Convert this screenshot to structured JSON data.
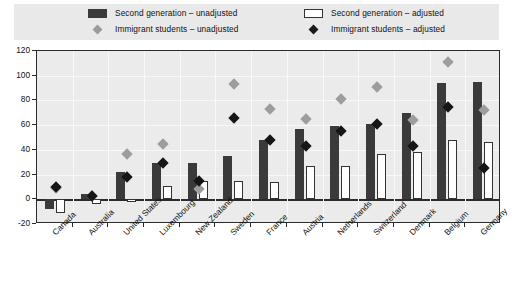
{
  "legend": {
    "items": [
      {
        "label": "Second generation – unadjusted",
        "marker": "dark-square",
        "color": "#3a3a3a"
      },
      {
        "label": "Immigrant students – unadjusted",
        "marker": "grey-diamond",
        "color": "#9d9d9d"
      },
      {
        "label": "Second generation – adjusted",
        "marker": "white-square",
        "color": "#ffffff"
      },
      {
        "label": "Immigrant students – adjusted",
        "marker": "black-diamond",
        "color": "#161616"
      }
    ]
  },
  "chart_data": {
    "type": "bar",
    "title": "",
    "xlabel": "",
    "ylabel": "",
    "ylim": [
      -20,
      120
    ],
    "yticks": [
      -20,
      0,
      20,
      40,
      60,
      80,
      100,
      120
    ],
    "grid": true,
    "legend_position": "top",
    "categories": [
      "Canada",
      "Australia",
      "United States",
      "Luxembourg",
      "New Zealand",
      "Sweden",
      "France",
      "Austria",
      "Netherlands",
      "Switzerland",
      "Denmark",
      "Belgium",
      "Germany"
    ],
    "series": [
      {
        "name": "Second generation – unadjusted",
        "type": "bar",
        "style": "dark",
        "values": [
          -8,
          4,
          22,
          29,
          29,
          35,
          48,
          57,
          59,
          61,
          70,
          94,
          95
        ]
      },
      {
        "name": "Second generation – adjusted",
        "type": "bar",
        "style": "white",
        "values": [
          -11,
          -4,
          -2,
          11,
          15,
          15,
          14,
          27,
          27,
          37,
          38,
          48,
          46
        ]
      },
      {
        "name": "Immigrant students – unadjusted",
        "type": "marker",
        "style": "grey-diamond",
        "values": [
          9,
          3,
          37,
          45,
          8,
          93,
          73,
          65,
          81,
          91,
          64,
          111,
          72
        ]
      },
      {
        "name": "Immigrant students – adjusted",
        "type": "marker",
        "style": "black-diamond",
        "values": [
          10,
          3,
          18,
          29,
          15,
          66,
          48,
          43,
          55,
          61,
          43,
          75,
          25
        ]
      }
    ]
  }
}
